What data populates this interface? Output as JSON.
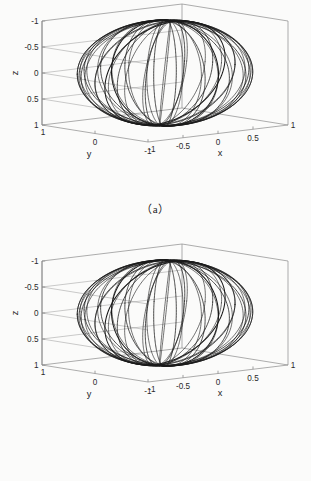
{
  "figure": {
    "background_color": "#fbfbfa",
    "line_color": "#1a1a1a",
    "axis_color": "#8a8a8a",
    "panels": [
      {
        "id": "a",
        "caption": "（a）",
        "axes": {
          "xlabel": "x",
          "ylabel": "y",
          "zlabel": "z",
          "xticks": [
            "-1",
            "-0.5",
            "0",
            "0.5",
            "1"
          ],
          "yticks": [
            "1",
            "0",
            "-1"
          ],
          "zticks": [
            "-1",
            "-0.5",
            "0",
            "0.5",
            "1"
          ],
          "corner_x_label": "-1",
          "corner_y_label": "1",
          "right_corner_label": "1"
        }
      },
      {
        "id": "b",
        "caption": "（b）",
        "axes": {
          "xlabel": "x",
          "ylabel": "y",
          "zlabel": "z",
          "xticks": [
            "-1",
            "-0.5",
            "0",
            "0.5",
            "1"
          ],
          "yticks": [
            "1",
            "0",
            "-1"
          ],
          "zticks": [
            "-1",
            "-0.5",
            "0",
            "0.5",
            "1"
          ],
          "corner_x_label": "-1",
          "corner_y_label": "1",
          "right_corner_label": "1"
        }
      }
    ]
  },
  "chart_data": [
    {
      "type": "line",
      "title": "",
      "panel": "a",
      "projection": "3d",
      "xlabel": "x",
      "ylabel": "y",
      "zlabel": "z",
      "xlim": [
        -1,
        1
      ],
      "ylim": [
        -1,
        1
      ],
      "zlim": [
        -1,
        1
      ],
      "z_axis_inverted": true,
      "xticks": [
        -1,
        -0.5,
        0,
        0.5,
        1
      ],
      "yticks": [
        1,
        0,
        -1
      ],
      "zticks": [
        -1,
        -0.5,
        0,
        0.5,
        1
      ],
      "grid": true,
      "legend": "none",
      "description": "Family of great-circle-like trajectories on the unit sphere forming a seam/spiral pattern converging at the two poles",
      "series": [
        {
          "name": "orbit-1",
          "inclination_deg": 88,
          "ascending_node_deg": 0
        },
        {
          "name": "orbit-2",
          "inclination_deg": 88,
          "ascending_node_deg": 20
        },
        {
          "name": "orbit-3",
          "inclination_deg": 88,
          "ascending_node_deg": 40
        },
        {
          "name": "orbit-4",
          "inclination_deg": 88,
          "ascending_node_deg": 60
        },
        {
          "name": "orbit-5",
          "inclination_deg": 88,
          "ascending_node_deg": 80
        },
        {
          "name": "orbit-6",
          "inclination_deg": 88,
          "ascending_node_deg": 100
        },
        {
          "name": "orbit-7",
          "inclination_deg": 88,
          "ascending_node_deg": 120
        },
        {
          "name": "orbit-8",
          "inclination_deg": 88,
          "ascending_node_deg": 140
        },
        {
          "name": "orbit-9",
          "inclination_deg": 88,
          "ascending_node_deg": 160
        },
        {
          "name": "equator-band-1",
          "inclination_deg": 84,
          "ascending_node_deg": 10
        },
        {
          "name": "equator-band-2",
          "inclination_deg": 84,
          "ascending_node_deg": 90
        }
      ]
    },
    {
      "type": "line",
      "title": "",
      "panel": "b",
      "projection": "3d",
      "xlabel": "x",
      "ylabel": "y",
      "zlabel": "z",
      "xlim": [
        -1,
        1
      ],
      "ylim": [
        -1,
        1
      ],
      "zlim": [
        -1,
        1
      ],
      "z_axis_inverted": true,
      "xticks": [
        -1,
        -0.5,
        0,
        0.5,
        1
      ],
      "yticks": [
        1,
        0,
        -1
      ],
      "zticks": [
        -1,
        -0.5,
        0,
        0.5,
        1
      ],
      "grid": true,
      "legend": "none",
      "description": "Family of great-circle-like trajectories on the unit sphere forming a seam/spiral pattern converging at the two poles",
      "series": [
        {
          "name": "orbit-1",
          "inclination_deg": 88,
          "ascending_node_deg": 0
        },
        {
          "name": "orbit-2",
          "inclination_deg": 88,
          "ascending_node_deg": 20
        },
        {
          "name": "orbit-3",
          "inclination_deg": 88,
          "ascending_node_deg": 40
        },
        {
          "name": "orbit-4",
          "inclination_deg": 88,
          "ascending_node_deg": 60
        },
        {
          "name": "orbit-5",
          "inclination_deg": 88,
          "ascending_node_deg": 80
        },
        {
          "name": "orbit-6",
          "inclination_deg": 88,
          "ascending_node_deg": 100
        },
        {
          "name": "orbit-7",
          "inclination_deg": 88,
          "ascending_node_deg": 120
        },
        {
          "name": "orbit-8",
          "inclination_deg": 88,
          "ascending_node_deg": 140
        },
        {
          "name": "orbit-9",
          "inclination_deg": 88,
          "ascending_node_deg": 160
        },
        {
          "name": "equator-band-1",
          "inclination_deg": 84,
          "ascending_node_deg": 10
        },
        {
          "name": "equator-band-2",
          "inclination_deg": 84,
          "ascending_node_deg": 90
        }
      ]
    }
  ]
}
